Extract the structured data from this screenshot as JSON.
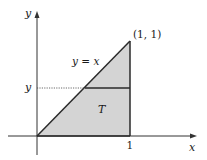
{
  "diagram": {
    "type": "region-of-integration",
    "colors": {
      "background": "#ffffff",
      "region_fill": "#d4d4d4",
      "stroke": "#2a2a2a",
      "axis": "#333333",
      "dotted_guide": "#444444"
    },
    "axes": {
      "x_label": "x",
      "y_label": "y"
    },
    "ticks": {
      "x_tick_label": "1",
      "y_level_label": "y"
    },
    "annotations": {
      "vertex_label": "(1, 1)",
      "line_label": "y = x",
      "region_label": "T"
    },
    "geometry": {
      "origin": [
        37,
        136
      ],
      "apex": [
        130,
        41
      ],
      "x_one": [
        130,
        136
      ],
      "horizontal_slice_y": 88,
      "slice_left_x": 85
    }
  }
}
